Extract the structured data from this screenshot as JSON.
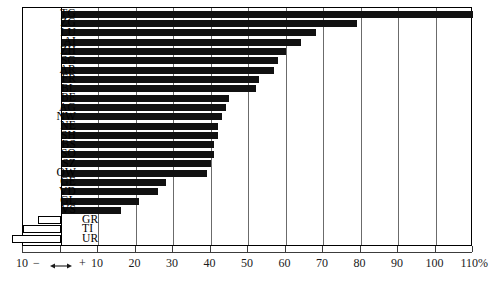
{
  "chart_data": {
    "type": "bar",
    "orientation": "horizontal",
    "title": "",
    "subtitle": "",
    "xlabel": "",
    "ylabel": "",
    "xlim": [
      -10,
      110
    ],
    "x_unit": "%",
    "grid": true,
    "grid_axis": "x",
    "legend": "none",
    "zero_line": true,
    "categories": [
      "TG",
      "ZG",
      "LU",
      "AI",
      "ZH",
      "SG",
      "AR",
      "FR",
      "BL",
      "BE",
      "AG",
      "NW",
      "NE",
      "SH",
      "BS",
      "SO",
      "SZ",
      "OW",
      "GE",
      "VD",
      "GL",
      "VS",
      "GR",
      "TI",
      "UR"
    ],
    "values": [
      110,
      79,
      68,
      64,
      60,
      58,
      57,
      53,
      52,
      45,
      44,
      43,
      42,
      42,
      41,
      41,
      40,
      39,
      28,
      26,
      21,
      16,
      -6,
      -10,
      -13
    ],
    "xticks": [
      -10,
      0,
      10,
      20,
      30,
      40,
      50,
      60,
      70,
      80,
      90,
      100,
      110
    ],
    "xticklabels": [
      "10",
      "",
      "10",
      "20",
      "30",
      "40",
      "50",
      "60",
      "70",
      "80",
      "90",
      "100",
      "110%"
    ],
    "series": [
      {
        "name": "change",
        "values": [
          110,
          79,
          68,
          64,
          60,
          58,
          57,
          53,
          52,
          45,
          44,
          43,
          42,
          42,
          41,
          41,
          40,
          39,
          28,
          26,
          21,
          16,
          -6,
          -10,
          -13
        ]
      }
    ],
    "bar_styles": {
      "positive_fill": "#111111",
      "negative_fill": "#ffffff",
      "negative_stroke": "#000000"
    }
  },
  "axis": {
    "negative_sign": "−",
    "positive_sign": "+",
    "unit_suffix": "%"
  },
  "colors": {
    "frame": "#000000",
    "grid": "#6b6b6b",
    "axis": "#3c3c3c",
    "bar_positive": "#111111",
    "bar_negative": "#ffffff",
    "text": "#000000",
    "background": "#ffffff"
  }
}
